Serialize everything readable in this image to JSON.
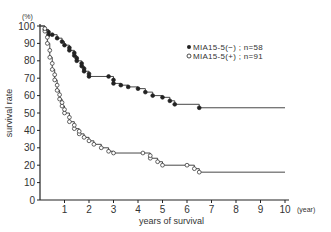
{
  "chart_data": {
    "type": "line",
    "subtype": "kaplan-meier step curve",
    "title": "",
    "xlabel": "years of survival",
    "x_unit": "(year)",
    "ylabel": "survival rate",
    "y_unit": "(%)",
    "xlim": [
      0,
      10
    ],
    "ylim": [
      0,
      100
    ],
    "x_ticks": [
      1,
      2,
      3,
      4,
      5,
      6,
      7,
      8,
      9,
      10
    ],
    "y_ticks": [
      0,
      10,
      20,
      30,
      40,
      50,
      60,
      70,
      80,
      90,
      100
    ],
    "grid": false,
    "legend_position": "upper right",
    "series": [
      {
        "name": "MIA15-5(−); n=58",
        "marker": "filled-circle",
        "x": [
          0,
          0.2,
          0.35,
          0.5,
          0.7,
          0.9,
          1.0,
          1.2,
          1.4,
          1.5,
          1.7,
          1.8,
          2.0,
          2.8,
          3.0,
          3.3,
          3.6,
          4.0,
          4.3,
          4.6,
          5.0,
          5.3,
          5.5,
          6.5,
          10
        ],
        "y": [
          100,
          98,
          95,
          95,
          93,
          91,
          89,
          86,
          83,
          80,
          77,
          74,
          71,
          71,
          67,
          66,
          65,
          64,
          62,
          60,
          59,
          57,
          55,
          53,
          53
        ]
      },
      {
        "name": "MIA15-5(+); n=91",
        "marker": "open-circle",
        "x": [
          0,
          0.2,
          0.3,
          0.4,
          0.5,
          0.6,
          0.7,
          0.8,
          0.9,
          1.0,
          1.2,
          1.4,
          1.6,
          1.8,
          2.0,
          2.2,
          2.5,
          2.8,
          3.0,
          4.2,
          4.5,
          4.8,
          5.0,
          6.0,
          6.3,
          6.5,
          10
        ],
        "y": [
          100,
          97,
          90,
          82,
          75,
          69,
          63,
          58,
          54,
          50,
          45,
          41,
          38,
          36,
          34,
          32,
          30,
          28,
          27,
          27,
          24,
          22,
          20,
          20,
          18,
          16,
          16
        ]
      }
    ]
  },
  "legend": {
    "items": [
      {
        "symbol": "●",
        "label": "MIA15-5(−) ; n=58"
      },
      {
        "symbol": "○",
        "label": "MIA15-5(+) ; n=91"
      }
    ]
  },
  "axes": {
    "y_unit_label": "(%)",
    "x_unit_label": "(year)",
    "x_title": "years of survival",
    "y_title": "survival rate",
    "y_tick_labels": [
      "0",
      "10",
      "20",
      "30",
      "40",
      "50",
      "60",
      "70",
      "80",
      "90",
      "100"
    ],
    "x_tick_labels": [
      "1",
      "2",
      "3",
      "4",
      "5",
      "6",
      "7",
      "8",
      "9",
      "10"
    ]
  }
}
